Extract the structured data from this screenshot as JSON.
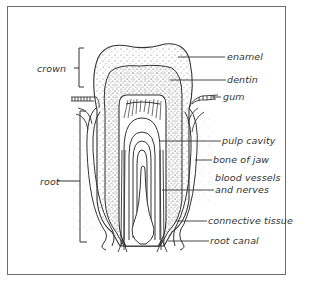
{
  "diagram": {
    "type": "labeled-illustration",
    "left_labels": [
      {
        "id": "crown",
        "text": "crown"
      },
      {
        "id": "root",
        "text": "root"
      }
    ],
    "right_labels": [
      {
        "id": "enamel",
        "text": "enamel"
      },
      {
        "id": "dentin",
        "text": "dentin"
      },
      {
        "id": "gum",
        "text": "gum"
      },
      {
        "id": "pulp_cavity",
        "text": "pulp cavity"
      },
      {
        "id": "bone_of_jaw",
        "text": "bone of jaw"
      },
      {
        "id": "blood_vessels_line1",
        "text": "blood vessels"
      },
      {
        "id": "blood_vessels_line2",
        "text": "and nerves"
      },
      {
        "id": "connective_tissue",
        "text": "connective tissue"
      },
      {
        "id": "root_canal",
        "text": "root canal"
      }
    ],
    "colors": {
      "ink": "#333333",
      "frame": "#6b6b6b",
      "background": "#ffffff"
    }
  }
}
